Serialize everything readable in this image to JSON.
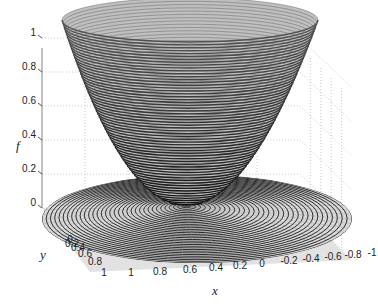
{
  "chart_data": {
    "type": "surface3d",
    "title": "",
    "function": "f = x^2 + y^2 (paraboloid), with contour rings projected on the floor",
    "xlabel": "x",
    "ylabel": "y",
    "zlabel": "f",
    "x_ticks": [
      "1",
      "0.8",
      "0.6",
      "0.4",
      "0.2",
      "0",
      "-0.2",
      "-0.4",
      "-0.6",
      "-0.8",
      "-1"
    ],
    "y_ticks": [
      "0",
      "0.2",
      "0.4",
      "0.6",
      "0.8",
      "1"
    ],
    "z_ticks": [
      "0",
      "0.2",
      "0.4",
      "0.6",
      "0.8",
      "1"
    ],
    "xlim": [
      -1,
      1
    ],
    "ylim": [
      -1,
      1
    ],
    "zlim": [
      0,
      1
    ],
    "grid": true,
    "colormap": "grayscale",
    "legend": null
  },
  "labels": {
    "x": "x",
    "y": "y",
    "z": "f"
  }
}
